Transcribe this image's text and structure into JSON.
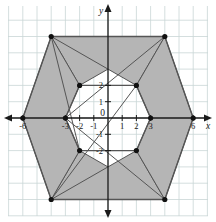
{
  "figure": {
    "axis_labels": {
      "x": "x",
      "y": "y"
    },
    "origin_label": "0",
    "x_tick_labels": [
      "-6",
      "-3",
      "-2",
      "-1",
      "1",
      "2",
      "3",
      "6"
    ],
    "y_tick_labels": [
      "2",
      "1",
      "-1",
      "-2"
    ],
    "colors": {
      "grid": "#c9d6d6",
      "axis": "#1a1a1a",
      "shade": "#b5b5b5",
      "outline": "#555555",
      "vertex": "#111111",
      "background": "#ffffff"
    }
  },
  "chart_data": {
    "type": "scatter",
    "xlabel": "x",
    "ylabel": "y",
    "xlim": [
      -7,
      7
    ],
    "ylim": [
      -7,
      7
    ],
    "grid": true,
    "legend": "none",
    "x_ticks": [
      -6,
      -3,
      -2,
      -1,
      0,
      1,
      2,
      3,
      6
    ],
    "y_ticks": [
      -2,
      -1,
      0,
      1,
      2
    ],
    "x_tick_labels": [
      "-6",
      "-3",
      "-2",
      "-1",
      "0",
      "1",
      "2",
      "3",
      "6"
    ],
    "y_tick_labels": [
      "-2",
      "-1",
      "0",
      "1",
      "2"
    ],
    "series": [
      {
        "name": "outer hexagon",
        "type": "polygon",
        "closed": true,
        "points": [
          [
            -6,
            0
          ],
          [
            -4,
            5
          ],
          [
            4,
            5
          ],
          [
            6,
            0
          ],
          [
            4,
            -5
          ],
          [
            -4,
            -5
          ]
        ]
      },
      {
        "name": "inner hexagon",
        "type": "polygon",
        "closed": true,
        "points": [
          [
            -3,
            0
          ],
          [
            -2,
            2
          ],
          [
            2,
            2
          ],
          [
            3,
            0
          ],
          [
            2,
            -2
          ],
          [
            -2,
            -2
          ]
        ]
      },
      {
        "name": "shaded region top",
        "type": "polygon-filled",
        "points": [
          [
            -4,
            5
          ],
          [
            4,
            5
          ],
          [
            -2,
            2
          ],
          [
            2,
            2
          ]
        ]
      },
      {
        "name": "shaded region bottom",
        "type": "polygon-filled",
        "points": [
          [
            -4,
            -5
          ],
          [
            4,
            -5
          ],
          [
            -2,
            -2
          ],
          [
            2,
            -2
          ]
        ]
      },
      {
        "name": "shaded region left",
        "type": "polygon-filled",
        "points": [
          [
            -6,
            0
          ],
          [
            -4,
            5
          ],
          [
            -2,
            2
          ],
          [
            -3,
            0
          ],
          [
            -2,
            -2
          ],
          [
            -4,
            -5
          ]
        ]
      },
      {
        "name": "shaded region right",
        "type": "polygon-filled",
        "points": [
          [
            6,
            0
          ],
          [
            4,
            5
          ],
          [
            2,
            2
          ],
          [
            3,
            0
          ],
          [
            2,
            -2
          ],
          [
            4,
            -5
          ]
        ]
      }
    ],
    "vertices": [
      [
        -6,
        0
      ],
      [
        -4,
        5
      ],
      [
        4,
        5
      ],
      [
        6,
        0
      ],
      [
        4,
        -5
      ],
      [
        -4,
        -5
      ],
      [
        -3,
        0
      ],
      [
        -2,
        2
      ],
      [
        2,
        2
      ],
      [
        3,
        0
      ],
      [
        2,
        -2
      ],
      [
        -2,
        -2
      ]
    ]
  }
}
